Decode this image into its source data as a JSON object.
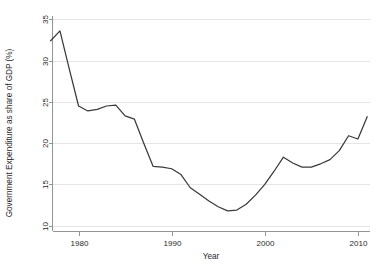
{
  "chart_data": {
    "type": "line",
    "title": "",
    "subtitle": "",
    "xlabel": "Year",
    "ylabel": "Government Expenditure as share of GDP (%)",
    "xlim": [
      1977.2,
      2011.3
    ],
    "ylim": [
      9.3,
      35.4
    ],
    "xticks": [
      1980,
      1990,
      2000,
      2010
    ],
    "xtick_labels": [
      "1980",
      "1990",
      "2000",
      "2010"
    ],
    "yticks": [
      10,
      15,
      20,
      25,
      30,
      35
    ],
    "ytick_labels": [
      "10",
      "15",
      "20",
      "25",
      "30",
      "35"
    ],
    "grid": true,
    "grid_axis": "y",
    "grid_color": "#e2e2e2",
    "legend": false,
    "legend_position": "none",
    "line_color": "#3a3a3a",
    "background_color": "#ffffff",
    "series": [
      {
        "name": "Government Expenditure as share of GDP (%)",
        "x": [
          1977,
          1978,
          1979,
          1980,
          1981,
          1982,
          1983,
          1984,
          1985,
          1986,
          1987,
          1988,
          1989,
          1990,
          1991,
          1992,
          1993,
          1994,
          1995,
          1996,
          1997,
          1998,
          1999,
          2000,
          2001,
          2002,
          2003,
          2004,
          2005,
          2006,
          2007,
          2008,
          2009,
          2010,
          2011
        ],
        "values": [
          32.4,
          33.6,
          29.0,
          24.5,
          23.9,
          24.1,
          24.5,
          24.6,
          23.3,
          22.9,
          20.0,
          17.2,
          17.1,
          16.9,
          16.2,
          14.6,
          13.8,
          13.0,
          12.3,
          11.8,
          11.9,
          12.6,
          13.7,
          15.0,
          16.6,
          18.3,
          17.6,
          17.1,
          17.1,
          17.5,
          18.0,
          19.1,
          20.9,
          20.5,
          23.2
        ]
      }
    ]
  },
  "axes": {
    "x_axis_title": "Year",
    "y_axis_title": "Government Expenditure as share of GDP (%)"
  }
}
